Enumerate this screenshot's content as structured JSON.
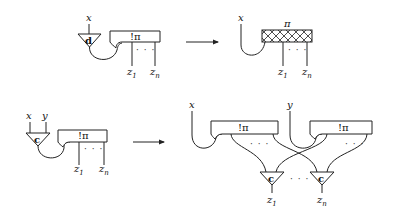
{
  "figure": {
    "rule_dereliction": {
      "lhs": {
        "input_label": "x",
        "node_label": "d",
        "box_label": "!π",
        "dots": "· · ·",
        "outputs": [
          {
            "base": "z",
            "sub": "1"
          },
          {
            "base": "z",
            "sub": "n"
          }
        ]
      },
      "rhs": {
        "input_label": "x",
        "box_label": "π",
        "box_style": "hatched",
        "dots": "· · ·",
        "outputs": [
          {
            "base": "z",
            "sub": "1"
          },
          {
            "base": "z",
            "sub": "n"
          }
        ]
      }
    },
    "rule_contraction": {
      "lhs": {
        "input_labels": [
          "x",
          "y"
        ],
        "node_label": "c",
        "box_label": "!π",
        "dots": "· · ·",
        "outputs": [
          {
            "base": "z",
            "sub": "1"
          },
          {
            "base": "z",
            "sub": "n"
          }
        ]
      },
      "rhs": {
        "input_labels": [
          "x",
          "y"
        ],
        "box_labels": [
          "!π",
          "!π"
        ],
        "node_labels": [
          "c",
          "c"
        ],
        "dots": "· · ·",
        "outputs": [
          {
            "base": "z",
            "sub": "1"
          },
          {
            "base": "z",
            "sub": "n"
          }
        ]
      }
    },
    "arrows": [
      "→",
      "→"
    ]
  }
}
